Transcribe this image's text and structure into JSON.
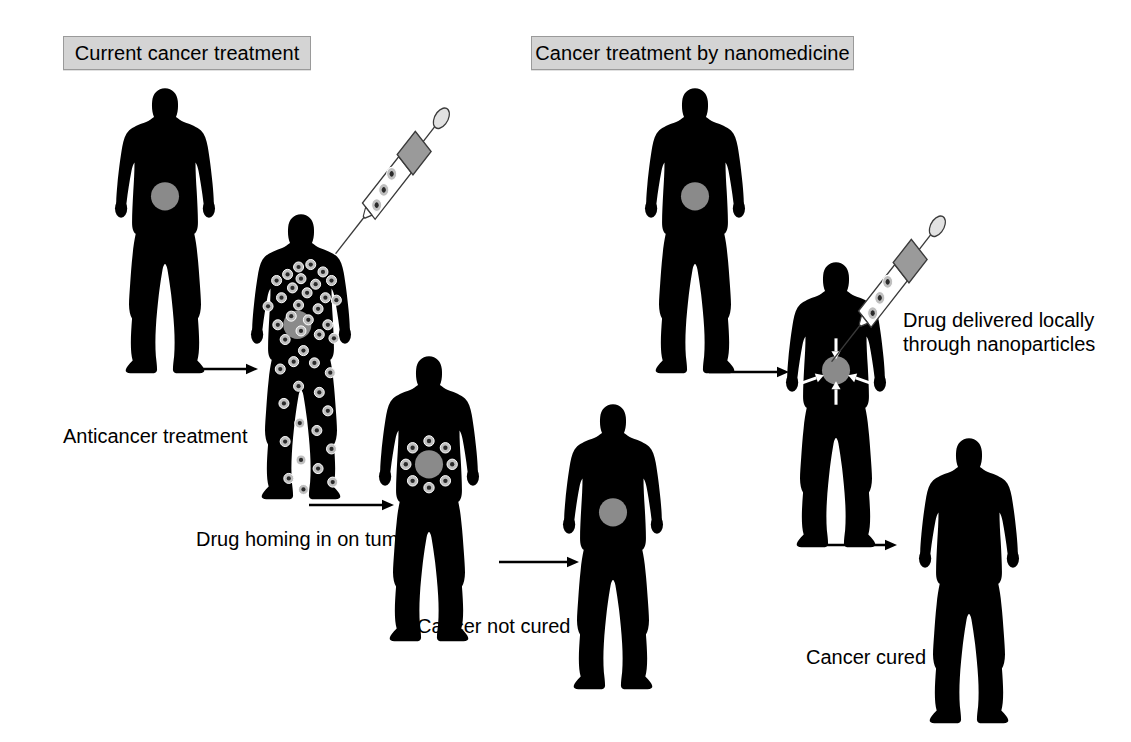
{
  "diagram": {
    "title_hidden": "",
    "background_color": "#ffffff",
    "silhouette_color": "#000000",
    "tumor_color": "#8a8a8a",
    "particle_color": "#bfbfbf",
    "header_fill": "#d4d4d4",
    "header_border": "#9a9a9a",
    "arrow_color": "#000000",
    "white_arrow_color": "#ffffff"
  },
  "headers": [
    {
      "id": "left-panel-header",
      "label": "Current cancer treatment",
      "x": 63,
      "y": 36,
      "w": 248,
      "h": 34
    },
    {
      "id": "right-panel-header",
      "label": "Cancer treatment by nanomedicine",
      "x": 531,
      "y": 36,
      "w": 323,
      "h": 34
    }
  ],
  "captions": [
    {
      "id": "caption-anticancer-treatment",
      "label": "Anticancer treatment",
      "x": 63,
      "y": 424
    },
    {
      "id": "caption-drug-homing",
      "label": "Drug homing in on tumor",
      "x": 196,
      "y": 527
    },
    {
      "id": "caption-cancer-not-cured",
      "label": "Cancer not cured",
      "x": 417,
      "y": 614
    },
    {
      "id": "caption-drug-delivered-line1",
      "label": "Drug delivered locally",
      "x": 903,
      "y": 308
    },
    {
      "id": "caption-drug-delivered-line2",
      "label": "through nanoparticles",
      "x": 903,
      "y": 332
    },
    {
      "id": "caption-cancer-cured",
      "label": "Cancer cured",
      "x": 806,
      "y": 645
    }
  ],
  "flow_arrows": [
    {
      "id": "arrow-anticancer-treatment",
      "x": 172,
      "y": 360,
      "length": 85
    },
    {
      "id": "arrow-drug-homing",
      "x": 308,
      "y": 496,
      "length": 85
    },
    {
      "id": "arrow-cancer-not-cured",
      "x": 498,
      "y": 553,
      "length": 80
    },
    {
      "id": "arrow-nanomedicine-inject",
      "x": 708,
      "y": 363,
      "length": 80
    },
    {
      "id": "arrow-cancer-cured",
      "x": 808,
      "y": 536,
      "length": 88
    }
  ],
  "figures": [
    {
      "id": "figure-left-untreated",
      "panel": "left",
      "state": "tumor only",
      "x": 104,
      "y": 82,
      "w": 122,
      "h": 295,
      "has_tumor": true,
      "particles": "none",
      "syringe": false,
      "converging_arrows": false
    },
    {
      "id": "figure-left-systemic-drug",
      "panel": "left",
      "state": "drug spread through whole body",
      "x": 240,
      "y": 208,
      "w": 122,
      "h": 295,
      "has_tumor": true,
      "particles": "scattered-body",
      "syringe": true,
      "converging_arrows": false
    },
    {
      "id": "figure-left-drug-homing",
      "panel": "left",
      "state": "drug ringed around tumor",
      "x": 368,
      "y": 350,
      "w": 122,
      "h": 295,
      "has_tumor": true,
      "particles": "ring-around-tumor",
      "syringe": false,
      "converging_arrows": false
    },
    {
      "id": "figure-left-not-cured",
      "panel": "left",
      "state": "tumor remains",
      "x": 552,
      "y": 398,
      "w": 122,
      "h": 295,
      "has_tumor": true,
      "particles": "none",
      "syringe": false,
      "converging_arrows": false
    },
    {
      "id": "figure-right-untreated",
      "panel": "right",
      "state": "tumor only",
      "x": 634,
      "y": 82,
      "w": 122,
      "h": 295,
      "has_tumor": true,
      "particles": "none",
      "syringe": false,
      "converging_arrows": false
    },
    {
      "id": "figure-right-targeted-delivery",
      "panel": "right",
      "state": "nanoparticles delivered locally to tumor",
      "x": 775,
      "y": 256,
      "w": 122,
      "h": 295,
      "has_tumor": true,
      "particles": "none",
      "syringe": true,
      "converging_arrows": true
    },
    {
      "id": "figure-right-cured",
      "panel": "right",
      "state": "no tumor",
      "x": 908,
      "y": 432,
      "w": 122,
      "h": 295,
      "has_tumor": false,
      "particles": "none",
      "syringe": false,
      "converging_arrows": false
    }
  ],
  "syringes": [
    {
      "id": "syringe-left",
      "x": 330,
      "y": 118,
      "w": 145,
      "h": 150,
      "needle_target": "figure-left-systemic-drug"
    },
    {
      "id": "syringe-right",
      "x": 826,
      "y": 226,
      "w": 145,
      "h": 150,
      "needle_target": "figure-right-targeted-delivery"
    }
  ]
}
